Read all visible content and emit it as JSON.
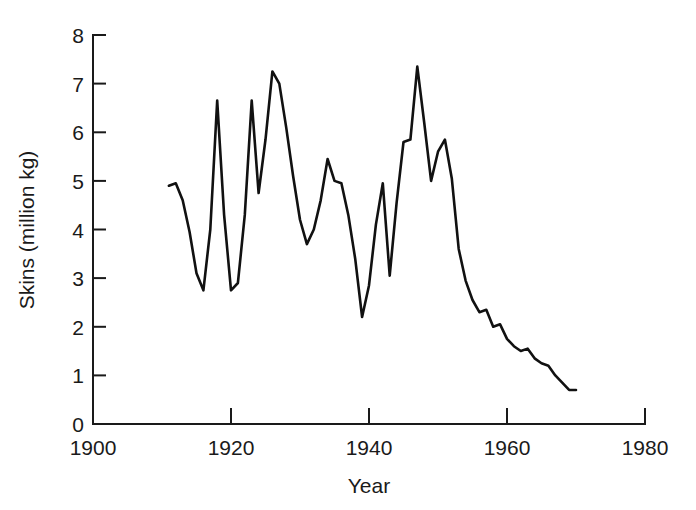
{
  "chart_data": {
    "type": "line",
    "title": "",
    "subtitle": "",
    "xlabel": "Year",
    "ylabel": "Skins (million kg)",
    "xlim": [
      1900,
      1980
    ],
    "ylim": [
      0,
      8
    ],
    "xticks": [
      1900,
      1920,
      1940,
      1960,
      1980
    ],
    "xtick_labels": [
      "1900",
      "1920",
      "1940",
      "1960",
      "1980"
    ],
    "yticks": [
      0,
      1,
      2,
      3,
      4,
      5,
      6,
      7,
      8
    ],
    "ytick_labels": [
      "0",
      "1",
      "2",
      "3",
      "4",
      "5",
      "6",
      "7",
      "8"
    ],
    "grid": false,
    "legend": null,
    "legend_position": "none",
    "annotations": [],
    "line_color": "#111111",
    "series": [
      {
        "name": "Skins",
        "x": [
          1911,
          1912,
          1913,
          1914,
          1915,
          1916,
          1917,
          1918,
          1919,
          1920,
          1921,
          1922,
          1923,
          1924,
          1925,
          1926,
          1927,
          1928,
          1929,
          1930,
          1931,
          1932,
          1933,
          1934,
          1935,
          1936,
          1937,
          1938,
          1939,
          1940,
          1941,
          1942,
          1943,
          1944,
          1945,
          1946,
          1947,
          1948,
          1949,
          1950,
          1951,
          1952,
          1953,
          1954,
          1955,
          1956,
          1957,
          1958,
          1959,
          1960,
          1961,
          1962,
          1963,
          1964,
          1965,
          1966,
          1967,
          1968,
          1969,
          1970
        ],
        "values": [
          4.9,
          4.95,
          4.6,
          3.95,
          3.1,
          2.75,
          4.0,
          6.65,
          4.3,
          2.75,
          2.9,
          4.3,
          6.65,
          4.75,
          5.85,
          7.25,
          7.0,
          6.1,
          5.1,
          4.2,
          3.7,
          4.0,
          4.6,
          5.45,
          5.0,
          4.95,
          4.3,
          3.4,
          2.2,
          2.85,
          4.1,
          4.95,
          3.05,
          4.55,
          5.8,
          5.85,
          7.35,
          6.2,
          5.0,
          5.6,
          5.85,
          5.05,
          3.6,
          2.95,
          2.55,
          2.3,
          2.35,
          2.0,
          2.05,
          1.75,
          1.6,
          1.5,
          1.55,
          1.35,
          1.25,
          1.2,
          1.0,
          0.85,
          0.7,
          0.7
        ]
      }
    ]
  },
  "axes": {
    "y_axis_title": "Skins (million kg)",
    "x_axis_title": "Year"
  }
}
